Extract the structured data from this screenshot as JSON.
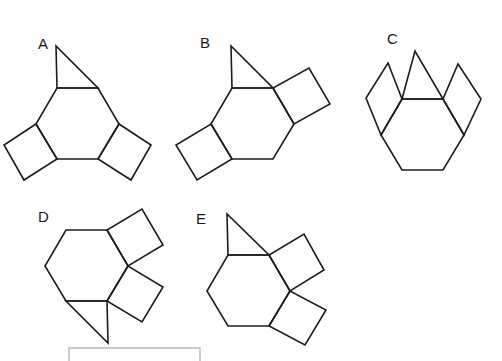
{
  "page": {
    "background_color": "#fefefe",
    "width": 502,
    "height": 361,
    "stroke_color": "#1c1c1c",
    "footer_frame_color": "#b8b8b8"
  },
  "figures": [
    {
      "id": "A",
      "label": "A",
      "description": "hexagon with equilateral triangle on top edge, square on lower-left edge, square on lower-right edge",
      "parts": [
        "hexagon",
        "triangle-top",
        "square-lower-left",
        "square-lower-right"
      ]
    },
    {
      "id": "B",
      "label": "B",
      "description": "hexagon with equilateral triangle on top edge, square on upper-right edge, square on lower-left edge",
      "parts": [
        "hexagon",
        "triangle-top",
        "square-upper-right",
        "square-lower-left"
      ]
    },
    {
      "id": "C",
      "label": "C",
      "description": "hexagon with equilateral triangle on top edge, square on upper-left edge, square on upper-right edge",
      "parts": [
        "hexagon",
        "triangle-top",
        "square-upper-left",
        "square-upper-right"
      ]
    },
    {
      "id": "D",
      "label": "D",
      "description": "hexagon with square on upper-right edge, square on lower-right edge, triangle below bottom edge",
      "parts": [
        "hexagon",
        "square-upper-right",
        "square-lower-right",
        "triangle-bottom"
      ]
    },
    {
      "id": "E",
      "label": "E",
      "description": "hexagon with equilateral triangle on top edge, square on upper-right edge, square on lower-right edge",
      "parts": [
        "hexagon",
        "triangle-top",
        "square-upper-right",
        "square-lower-right"
      ]
    }
  ],
  "footer": {
    "frame_present": true,
    "frame_label": ""
  },
  "geometry": {
    "A": {
      "hexagon": "78,73 108,90 108,125 78,142 48,125 48,90",
      "triangle": "78,73 108,90 57,56",
      "square_left": "48,90 48,125 19,155 14,117",
      "square_right": "108,90 108,125 140,152 143,115"
    },
    "B": {
      "hexagon": "240,86 270,103 270,138 240,155 210,138 210,103",
      "triangle": "210,103 270,103 232,53",
      "square_upper_right": "270,103 270,138 312,135 298,92",
      "square_lower_left": "210,138 240,155 221,188 186,171"
    },
    "C": {
      "hexagon": "419,97 449,114 449,149 419,166 389,149 389,114"
    },
    "D": {
      "hexagon": "100,250 130,267 130,302 100,319 70,302 70,267"
    },
    "E": {
      "hexagon": "262,253 292,270 292,305 262,322 232,305 232,270"
    }
  }
}
